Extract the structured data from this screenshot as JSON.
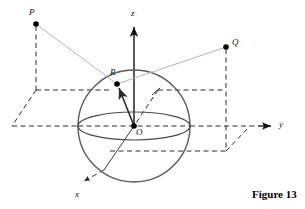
{
  "figure": {
    "caption": "Figure 13",
    "type": "3d-geometry-diagram",
    "colors": {
      "stroke_dark": "#1a1a1a",
      "sphere_stroke": "#595959",
      "dashed_stroke": "#2b2b2b",
      "light_ray": "#b3b3b3",
      "point_fill": "#000000",
      "background": "#ffffff"
    }
  },
  "axes": [
    {
      "name": "z",
      "label": "z",
      "label_x": 131,
      "label_y": 9,
      "direction": "up"
    },
    {
      "name": "y",
      "label": "y",
      "label_x": 279,
      "label_y": 120,
      "direction": "right"
    },
    {
      "name": "x",
      "label": "x",
      "label_x": 75,
      "label_y": 190,
      "direction": "down-left"
    }
  ],
  "points": [
    {
      "name": "P",
      "label": "P",
      "x": 36,
      "y": 24,
      "label_x": 29,
      "label_y": 8,
      "on_sphere": false
    },
    {
      "name": "Q",
      "label": "Q",
      "x": 226,
      "y": 47,
      "label_x": 232,
      "label_y": 38,
      "on_sphere": false
    },
    {
      "name": "R",
      "label": "R",
      "x": 117,
      "y": 84,
      "label_x": 110,
      "label_y": 68,
      "on_sphere": true
    },
    {
      "name": "O",
      "label": "O",
      "x": 134,
      "y": 126,
      "label_x": 136,
      "label_y": 128,
      "on_sphere": false
    }
  ],
  "sphere": {
    "center_x": 134,
    "center_y": 126,
    "radius": 56,
    "equator_rx": 56,
    "equator_ry": 14
  },
  "segments": [
    {
      "name": "ray-P-to-R",
      "from": "P",
      "to": "R",
      "style": "light-solid"
    },
    {
      "name": "ray-R-to-Q",
      "from": "R",
      "to": "Q",
      "style": "light-solid"
    },
    {
      "name": "radius-O-to-R",
      "from": "O",
      "to": "R",
      "style": "solid-arrow"
    }
  ],
  "caption_position": {
    "x": 252,
    "y": 188
  }
}
